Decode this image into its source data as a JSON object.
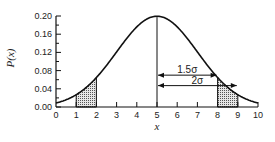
{
  "chart_data": {
    "type": "line",
    "title": "",
    "xlabel": "x",
    "ylabel": "P(x)",
    "xlim": [
      0,
      10
    ],
    "ylim": [
      0,
      0.2
    ],
    "x_ticks": [
      "0",
      "1",
      "2",
      "3",
      "4",
      "5",
      "6",
      "7",
      "8",
      "9",
      "10"
    ],
    "y_ticks": [
      "0.00",
      "0.04",
      "0.08",
      "0.12",
      "0.16",
      "0.20"
    ],
    "grid": false,
    "legend": null,
    "series": [
      {
        "name": "Gaussian distribution (mean 5, sigma 2)",
        "mean": 5,
        "sigma": 2,
        "x": [
          0,
          0.5,
          1,
          1.5,
          2,
          2.5,
          3,
          3.5,
          4,
          4.5,
          5,
          5.5,
          6,
          6.5,
          7,
          7.5,
          8,
          8.5,
          9,
          9.5,
          10
        ],
        "values": [
          0.009,
          0.013,
          0.027,
          0.042,
          0.065,
          0.091,
          0.121,
          0.151,
          0.176,
          0.193,
          0.199,
          0.193,
          0.176,
          0.151,
          0.121,
          0.091,
          0.065,
          0.042,
          0.027,
          0.013,
          0.009
        ]
      }
    ],
    "shaded_regions": [
      {
        "x_from": 1,
        "x_to": 2
      },
      {
        "x_from": 8,
        "x_to": 9
      }
    ],
    "annotations": [
      {
        "label": "1.5σ",
        "from_x": 5,
        "to_x": 8,
        "y": 0.07
      },
      {
        "label": "2σ",
        "from_x": 5,
        "to_x": 9,
        "y": 0.047
      }
    ],
    "vertical_line_at_x": 5
  }
}
